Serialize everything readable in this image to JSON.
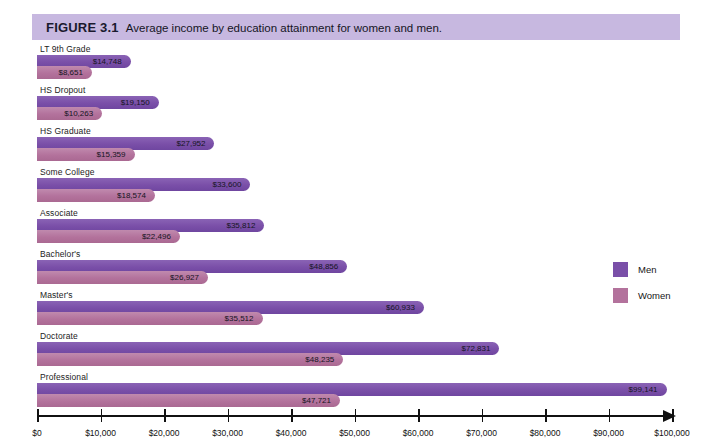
{
  "figure": {
    "number": "FIGURE 3.1",
    "title": "Average income by education attainment for women and men."
  },
  "legend": {
    "men_label": "Men",
    "women_label": "Women",
    "men_color": "#7a4fa8",
    "women_color": "#b3729c"
  },
  "axis": {
    "ticks": [
      {
        "label": "$0",
        "value": 0
      },
      {
        "label": "$10,000",
        "value": 10000
      },
      {
        "label": "$20,000",
        "value": 20000
      },
      {
        "label": "$30,000",
        "value": 30000
      },
      {
        "label": "$40,000",
        "value": 40000
      },
      {
        "label": "$50,000",
        "value": 50000
      },
      {
        "label": "$60,000",
        "value": 60000
      },
      {
        "label": "$70,000",
        "value": 70000
      },
      {
        "label": "$80,000",
        "value": 80000
      },
      {
        "label": "$90,000",
        "value": 90000
      },
      {
        "label": "$100,000",
        "value": 100000
      }
    ]
  },
  "chart_data": {
    "type": "bar",
    "orientation": "horizontal",
    "title": "Average income by education attainment for women and men.",
    "xlabel": "",
    "ylabel": "",
    "xlim": [
      0,
      100000
    ],
    "grid": false,
    "legend_position": "right",
    "categories": [
      "LT 9th Grade",
      "HS Dropout",
      "HS Graduate",
      "Some College",
      "Associate",
      "Bachelor's",
      "Master's",
      "Doctorate",
      "Professional"
    ],
    "series": [
      {
        "name": "Men",
        "color": "#7a4fa8",
        "values": [
          14748,
          19150,
          27952,
          33600,
          35812,
          48856,
          60933,
          72831,
          99141
        ],
        "labels": [
          "$14,748",
          "$19,150",
          "$27,952",
          "$33,600",
          "$35,812",
          "$48,856",
          "$60,933",
          "$72,831",
          "$99,141"
        ]
      },
      {
        "name": "Women",
        "color": "#b3729c",
        "values": [
          8651,
          10263,
          15359,
          18574,
          22496,
          26927,
          35512,
          48235,
          47721
        ],
        "labels": [
          "$8,651",
          "$10,263",
          "$15,359",
          "$18,574",
          "$22,496",
          "$26,927",
          "$35,512",
          "$48,235",
          "$47,721"
        ]
      }
    ]
  }
}
